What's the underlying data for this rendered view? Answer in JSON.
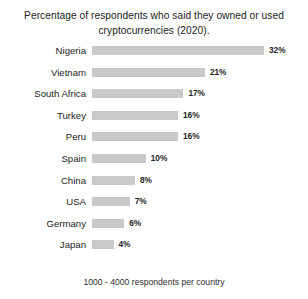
{
  "chart_data": {
    "type": "bar",
    "orientation": "horizontal",
    "title": "Percentage of respondents who said they owned or used cryptocurrencies (2020).",
    "footnote": "1000 - 4000 respondents per country",
    "xlabel": "",
    "ylabel": "",
    "xlim": [
      0,
      32
    ],
    "grid": false,
    "legend": false,
    "bar_color": "#c9c9c9",
    "text_color": "#232323",
    "background": "#ffffff",
    "categories": [
      "Nigeria",
      "Vietnam",
      "South Africa",
      "Turkey",
      "Peru",
      "Spain",
      "China",
      "USA",
      "Germany",
      "Japan"
    ],
    "values": [
      32,
      21,
      17,
      16,
      16,
      10,
      8,
      7,
      6,
      4
    ],
    "value_labels": [
      "32%",
      "21%",
      "17%",
      "16%",
      "16%",
      "10%",
      "8%",
      "7%",
      "6%",
      "4%"
    ]
  }
}
